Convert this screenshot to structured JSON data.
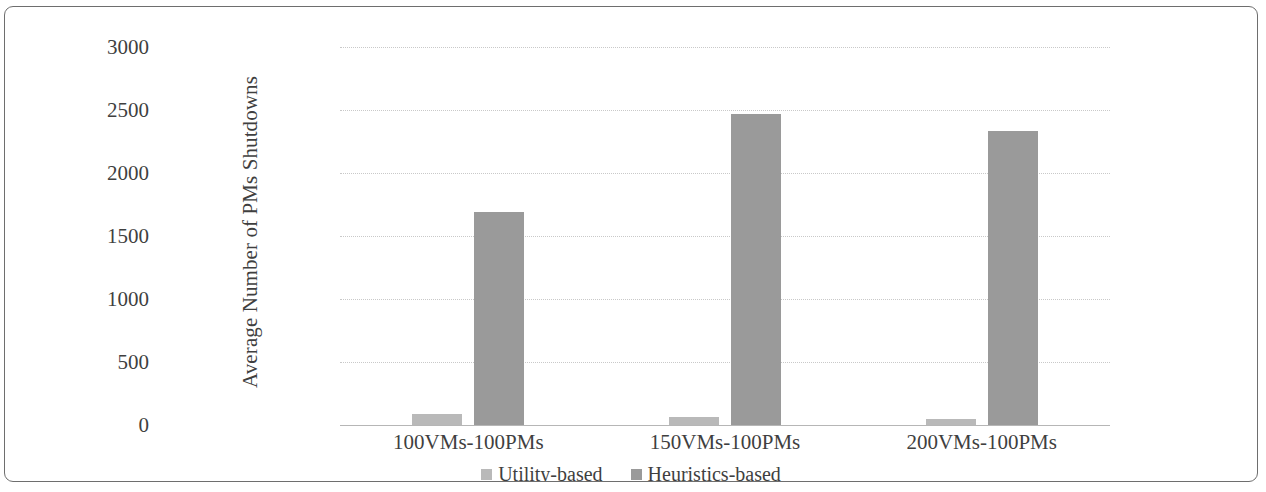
{
  "chart_data": {
    "type": "bar",
    "title": "",
    "xlabel": "",
    "ylabel": "Average Number of PMs Shutdowns",
    "categories": [
      "100VMs-100PMs",
      "150VMs-100PMs",
      "200VMs-100PMs"
    ],
    "series": [
      {
        "name": "Utility-based",
        "values": [
          85,
          65,
          50
        ],
        "color": "#b9b9b9"
      },
      {
        "name": "Heuristics-based",
        "values": [
          1690,
          2470,
          2335
        ],
        "color": "#9a9a9a"
      }
    ],
    "ylim": [
      0,
      3000
    ],
    "ytick_labels": [
      "0",
      "500",
      "1000",
      "1500",
      "2000",
      "2500",
      "3000"
    ],
    "ytick_values": [
      0,
      500,
      1000,
      1500,
      2000,
      2500,
      3000
    ],
    "grid": "horizontal-dotted",
    "legend_position": "bottom-center",
    "frame": "rounded-rectangle-border"
  }
}
